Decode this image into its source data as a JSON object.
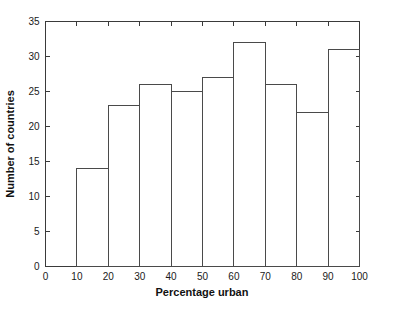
{
  "chart_data": {
    "type": "bar",
    "title": "",
    "subtitle": "",
    "xlabel": "Percentage urban",
    "ylabel": "Number of countries",
    "xlim": [
      0,
      100
    ],
    "ylim": [
      0,
      35
    ],
    "grid": false,
    "legend": null,
    "bin_width": 10,
    "x_ticks": [
      0,
      10,
      20,
      30,
      40,
      50,
      60,
      70,
      80,
      90,
      100
    ],
    "x_tick_labels": [
      "0",
      "10",
      "20",
      "30",
      "40",
      "50",
      "60",
      "70",
      "80",
      "90",
      "100"
    ],
    "y_ticks": [
      0,
      5,
      10,
      15,
      20,
      25,
      30,
      35
    ],
    "y_tick_labels": [
      "0",
      "5",
      "10",
      "15",
      "20",
      "25",
      "30",
      "35"
    ],
    "bins": [
      {
        "start": 0,
        "end": 10,
        "label": "0-10",
        "value": 0
      },
      {
        "start": 10,
        "end": 20,
        "label": "10-20",
        "value": 14
      },
      {
        "start": 20,
        "end": 30,
        "label": "20-30",
        "value": 23
      },
      {
        "start": 30,
        "end": 40,
        "label": "30-40",
        "value": 26
      },
      {
        "start": 40,
        "end": 50,
        "label": "40-50",
        "value": 25
      },
      {
        "start": 50,
        "end": 60,
        "label": "50-60",
        "value": 27
      },
      {
        "start": 60,
        "end": 70,
        "label": "60-70",
        "value": 32
      },
      {
        "start": 70,
        "end": 80,
        "label": "70-80",
        "value": 26
      },
      {
        "start": 80,
        "end": 90,
        "label": "80-90",
        "value": 22
      },
      {
        "start": 90,
        "end": 100,
        "label": "90-100",
        "value": 31
      }
    ],
    "categories": [
      "0-10",
      "10-20",
      "20-30",
      "30-40",
      "40-50",
      "50-60",
      "60-70",
      "70-80",
      "80-90",
      "90-100"
    ],
    "values": [
      0,
      14,
      23,
      26,
      25,
      27,
      32,
      26,
      22,
      31
    ],
    "colors": {
      "bar_stroke": "#4a4a4a",
      "bar_fill": "none",
      "axis": "#3a3a3a",
      "text": "#1a1a1a",
      "background": "#ffffff"
    }
  }
}
